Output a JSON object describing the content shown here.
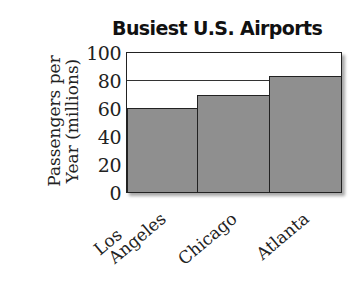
{
  "chart_data": {
    "type": "bar",
    "title": "Busiest U.S. Airports",
    "xlabel": "",
    "ylabel": "Passengers per Year (millions)",
    "ylabel_lines": [
      "Passengers per",
      "Year (millions)"
    ],
    "categories": [
      "Los Angeles",
      "Chicago",
      "Atlanta"
    ],
    "category_label_lines": [
      [
        "Los",
        "Angeles"
      ],
      [
        "Chicago"
      ],
      [
        "Atlanta"
      ]
    ],
    "values": [
      61,
      70,
      84
    ],
    "ylim": [
      0,
      100
    ],
    "yticks": [
      0,
      20,
      40,
      60,
      80,
      100
    ],
    "gridlines": [
      80
    ],
    "grid": "partial",
    "legend": null,
    "bar_color": "#8f8f8f"
  }
}
